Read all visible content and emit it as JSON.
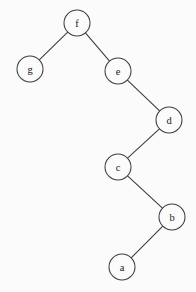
{
  "diagram": {
    "background_color": "#fbfbfb",
    "node_fill_color": "#fbfbfb",
    "node_stroke_color": "#3d3d3d",
    "edge_color": "#3a3a3a",
    "label_color": "#1a1a1a",
    "node_radius": 13
  },
  "chart_data": {
    "type": "diagram",
    "title": "",
    "nodes": [
      {
        "id": "f",
        "label": "f",
        "x": 77,
        "y": 23
      },
      {
        "id": "g",
        "label": "g",
        "x": 30,
        "y": 69
      },
      {
        "id": "e",
        "label": "e",
        "x": 118,
        "y": 71
      },
      {
        "id": "d",
        "label": "d",
        "x": 169,
        "y": 120
      },
      {
        "id": "c",
        "label": "c",
        "x": 118,
        "y": 167
      },
      {
        "id": "b",
        "label": "b",
        "x": 172,
        "y": 217
      },
      {
        "id": "a",
        "label": "a",
        "x": 122,
        "y": 267
      }
    ],
    "edges": [
      {
        "from": "f",
        "to": "g",
        "relation": "left-child"
      },
      {
        "from": "f",
        "to": "e",
        "relation": "right-child"
      },
      {
        "from": "e",
        "to": "d",
        "relation": "right-child"
      },
      {
        "from": "d",
        "to": "c",
        "relation": "left-child"
      },
      {
        "from": "c",
        "to": "b",
        "relation": "right-child"
      },
      {
        "from": "b",
        "to": "a",
        "relation": "left-child"
      }
    ],
    "root": "f",
    "labels": [
      "f",
      "g",
      "e",
      "d",
      "c",
      "b",
      "a"
    ]
  }
}
